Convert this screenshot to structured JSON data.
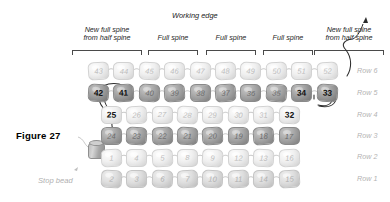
{
  "figure": {
    "caption": "Figure 27",
    "working_edge_label": "Working edge",
    "stop_bead_label": "Stop bead"
  },
  "spine_labels": [
    {
      "line1": "New full spine",
      "line2": "from half spine"
    },
    {
      "line1": "Full spine",
      "line2": ""
    },
    {
      "line1": "Full spine",
      "line2": ""
    },
    {
      "line1": "Full spine",
      "line2": ""
    },
    {
      "line1": "New full spine",
      "line2": "from half spine"
    }
  ],
  "row_labels": [
    "Row 6",
    "Row 5",
    "Row 4",
    "Row 3",
    "Row 2",
    "Row 1"
  ],
  "rows": [
    {
      "name": "Row 6",
      "beads": [
        {
          "n": "43",
          "shade": "light",
          "hl": false
        },
        {
          "n": "44",
          "shade": "light",
          "hl": false
        },
        {
          "n": "45",
          "shade": "light",
          "hl": false
        },
        {
          "n": "46",
          "shade": "light",
          "hl": false
        },
        {
          "n": "47",
          "shade": "light",
          "hl": false
        },
        {
          "n": "48",
          "shade": "light",
          "hl": false
        },
        {
          "n": "49",
          "shade": "light",
          "hl": false
        },
        {
          "n": "50",
          "shade": "light",
          "hl": false
        },
        {
          "n": "51",
          "shade": "light",
          "hl": false
        },
        {
          "n": "52",
          "shade": "light",
          "hl": false
        }
      ]
    },
    {
      "name": "Row 5",
      "beads": [
        {
          "n": "42",
          "shade": "dark",
          "hl": true
        },
        {
          "n": "41",
          "shade": "dark",
          "hl": true
        },
        {
          "n": "40",
          "shade": "dark",
          "hl": false
        },
        {
          "n": "39",
          "shade": "dark",
          "hl": false
        },
        {
          "n": "38",
          "shade": "dark",
          "hl": false
        },
        {
          "n": "37",
          "shade": "dark",
          "hl": false
        },
        {
          "n": "36",
          "shade": "dark",
          "hl": false
        },
        {
          "n": "35",
          "shade": "dark",
          "hl": false
        },
        {
          "n": "34",
          "shade": "dark",
          "hl": true
        },
        {
          "n": "33",
          "shade": "dark",
          "hl": true
        }
      ]
    },
    {
      "name": "Row 4",
      "beads": [
        {
          "n": "25",
          "shade": "light",
          "hl": true
        },
        {
          "n": "26",
          "shade": "light",
          "hl": false
        },
        {
          "n": "27",
          "shade": "light",
          "hl": false
        },
        {
          "n": "28",
          "shade": "light",
          "hl": false
        },
        {
          "n": "29",
          "shade": "light",
          "hl": false
        },
        {
          "n": "30",
          "shade": "light",
          "hl": false
        },
        {
          "n": "31",
          "shade": "light",
          "hl": false
        },
        {
          "n": "32",
          "shade": "light",
          "hl": true
        }
      ]
    },
    {
      "name": "Row 3",
      "beads": [
        {
          "n": "24",
          "shade": "dark",
          "hl": false
        },
        {
          "n": "23",
          "shade": "dark",
          "hl": false
        },
        {
          "n": "22",
          "shade": "dark",
          "hl": false
        },
        {
          "n": "21",
          "shade": "dark",
          "hl": false
        },
        {
          "n": "20",
          "shade": "dark",
          "hl": false
        },
        {
          "n": "19",
          "shade": "dark",
          "hl": false
        },
        {
          "n": "18",
          "shade": "dark",
          "hl": false
        },
        {
          "n": "17",
          "shade": "dark",
          "hl": false
        }
      ]
    },
    {
      "name": "Row 2",
      "beads": [
        {
          "n": "1",
          "shade": "light",
          "hl": false
        },
        {
          "n": "4",
          "shade": "light",
          "hl": false
        },
        {
          "n": "5",
          "shade": "light",
          "hl": false
        },
        {
          "n": "8",
          "shade": "light",
          "hl": false
        },
        {
          "n": "9",
          "shade": "light",
          "hl": false
        },
        {
          "n": "12",
          "shade": "light",
          "hl": false
        },
        {
          "n": "13",
          "shade": "light",
          "hl": false
        },
        {
          "n": "16",
          "shade": "light",
          "hl": false
        }
      ]
    },
    {
      "name": "Row 1",
      "beads": [
        {
          "n": "2",
          "shade": "mid",
          "hl": false
        },
        {
          "n": "3",
          "shade": "mid",
          "hl": false
        },
        {
          "n": "6",
          "shade": "mid",
          "hl": false
        },
        {
          "n": "7",
          "shade": "mid",
          "hl": false
        },
        {
          "n": "10",
          "shade": "mid",
          "hl": false
        },
        {
          "n": "11",
          "shade": "mid",
          "hl": false
        },
        {
          "n": "14",
          "shade": "mid",
          "hl": false
        },
        {
          "n": "15",
          "shade": "mid",
          "hl": false
        }
      ]
    }
  ],
  "colors": {
    "ink": "#1a1a1a",
    "muted": "#b3b3b3",
    "bead_dark": "#9a9a9a",
    "bead_light": "#e8e8e8"
  }
}
